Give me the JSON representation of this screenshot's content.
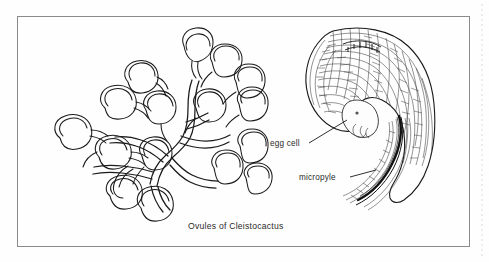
{
  "figure": {
    "caption": "Ovules of Cleistocactus",
    "frame": {
      "color": "#8a8a8a",
      "x": 17,
      "y": 16,
      "width": 453,
      "height": 231
    },
    "background_color": "#fefefe",
    "ink_color": "#1a1a1a",
    "page_edge_line_color": "#cfcfcf"
  },
  "panels": [
    {
      "id": "left-panel",
      "name": "placenta-with-ovules",
      "description": "Branching placenta bearing numerous kidney-shaped ovules on curved funicles",
      "ovule_count": 16
    },
    {
      "id": "right-panel",
      "name": "ovule-longitudinal-section",
      "description": "Campylotropous ovule in longitudinal section showing cellular integuments, embryo sac, egg cell and micropyle"
    }
  ],
  "annotations": [
    {
      "id": "egg-cell",
      "label": "egg cell",
      "text_x": 270,
      "text_y": 146,
      "leader": {
        "x1": 309,
        "y1": 143,
        "x2": 347,
        "y2": 120
      }
    },
    {
      "id": "micropyle",
      "label": "micropyle",
      "text_x": 299,
      "text_y": 180,
      "leader": {
        "x1": 350,
        "y1": 177,
        "x2": 375,
        "y2": 171
      }
    }
  ],
  "caption_position": {
    "x": 188,
    "y": 228
  }
}
